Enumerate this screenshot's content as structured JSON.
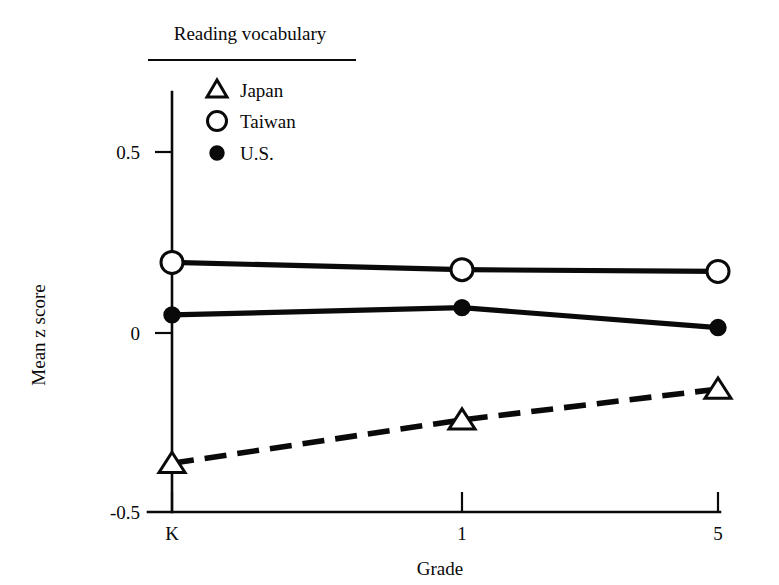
{
  "chart_data": {
    "type": "line",
    "title": "",
    "xlabel": "Grade",
    "ylabel": "Mean z score",
    "categories": [
      "K",
      "1",
      "5"
    ],
    "xtick_labels": [
      "K",
      "1",
      "5"
    ],
    "ytick_labels": [
      "0.5",
      "0",
      "-0.5"
    ],
    "ytick_values": [
      0.5,
      0,
      -0.5
    ],
    "ylim": [
      -0.5,
      0.62
    ],
    "grid": false,
    "legend_position": "top-left-inside",
    "legend_title": "Reading vocabulary",
    "series": [
      {
        "name": "Japan",
        "marker": "open-triangle",
        "line_style": "dashed",
        "values": [
          -0.36,
          -0.24,
          -0.155
        ]
      },
      {
        "name": "Taiwan",
        "marker": "open-circle",
        "line_style": "solid",
        "values": [
          0.195,
          0.175,
          0.17
        ]
      },
      {
        "name": "U.S.",
        "marker": "filled-circle",
        "line_style": "solid",
        "values": [
          0.05,
          0.07,
          0.015
        ]
      }
    ]
  },
  "legend": {
    "title": "Reading vocabulary",
    "entries": [
      {
        "label": "Japan",
        "marker_name": "open-triangle-marker"
      },
      {
        "label": "Taiwan",
        "marker_name": "open-circle-marker"
      },
      {
        "label": "U.S.",
        "marker_name": "filled-circle-marker"
      }
    ]
  },
  "axes": {
    "y_title": "Mean z score",
    "x_title": "Grade",
    "y_ticks": [
      "0.5",
      "0",
      "-0.5"
    ],
    "x_ticks": [
      "K",
      "1",
      "5"
    ]
  },
  "colors": {
    "ink": "#0a0a0a",
    "paper": "#ffffff"
  }
}
